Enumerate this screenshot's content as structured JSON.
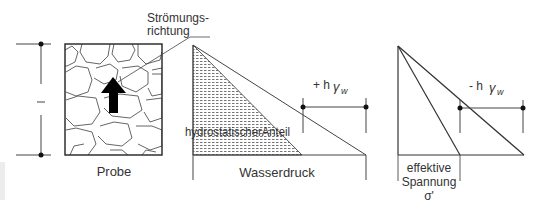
{
  "diagram": {
    "sample": {
      "label": "Probe",
      "length_label": "l",
      "flow_label_line1": "Strömungs-",
      "flow_label_line2": "richtung"
    },
    "water_pressure": {
      "label": "Wasserdruck",
      "hydrostatic_label": "hydrostatischerAnteil",
      "delta_label_sign": "+ h",
      "delta_label_gamma": "γ",
      "delta_label_sub": "w"
    },
    "effective_stress": {
      "label_line1": "effektive",
      "label_line2": "Spannung",
      "label_line3": "σ'",
      "delta_label_sign": "- h",
      "delta_label_gamma": "γ",
      "delta_label_sub": "w"
    },
    "colors": {
      "line": "#333333",
      "grain": "#555555",
      "hatch": "#666666",
      "side_box": "#ececec"
    }
  }
}
